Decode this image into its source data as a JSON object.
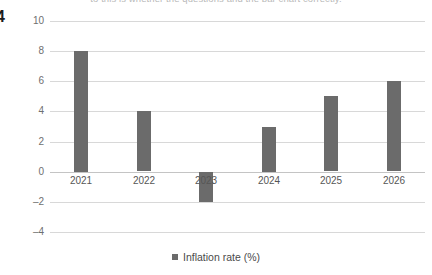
{
  "page": {
    "number": "4",
    "top_clipped_text": "to this is whether the questions and the bar chart correctly."
  },
  "legend": {
    "label": "Inflation rate (%)",
    "marker_color": "#6b6b6b",
    "position": "bottom-center"
  },
  "colors": {
    "bar": "#6b6b6b",
    "gridline": "#d8d8d8",
    "zero_line": "#c4c4c4",
    "background": "#ffffff",
    "tick_label": "#6f6f6f"
  },
  "chart_data": {
    "type": "bar",
    "title": "",
    "xlabel": "",
    "ylabel": "",
    "categories": [
      "2021",
      "2022",
      "2023",
      "2024",
      "2025",
      "2026"
    ],
    "values": [
      8,
      4,
      -2,
      3,
      5,
      6
    ],
    "series": [
      {
        "name": "Inflation rate (%)",
        "values": [
          8,
          4,
          -2,
          3,
          5,
          6
        ]
      }
    ],
    "ylim": [
      -4,
      10
    ],
    "ytick_values": [
      10,
      8,
      6,
      4,
      2,
      0,
      -2,
      -4
    ],
    "ytick_labels": [
      "10",
      "8",
      "6",
      "4",
      "2",
      "0",
      "–2",
      "–4"
    ],
    "grid": true,
    "orientation": "vertical"
  }
}
